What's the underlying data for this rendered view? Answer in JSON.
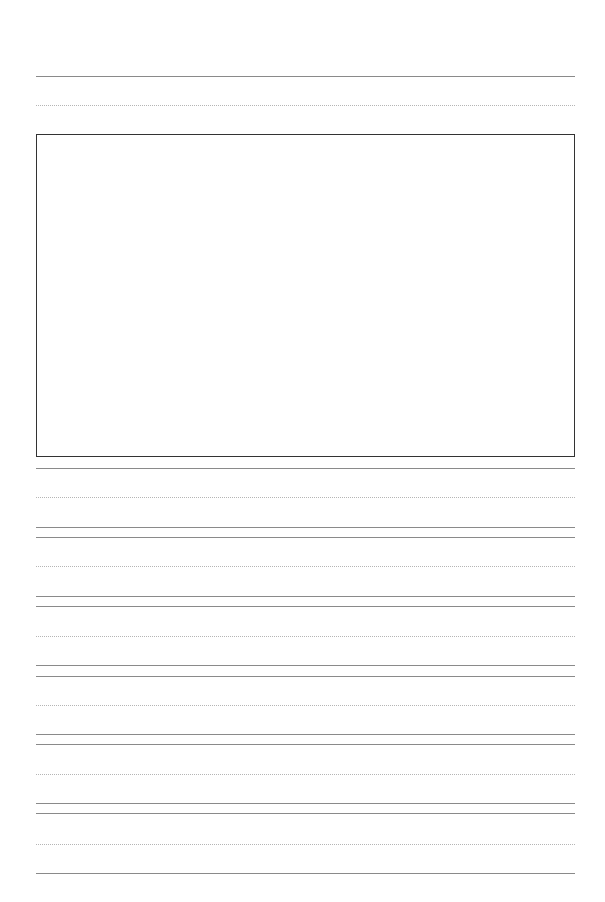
{
  "page": {
    "type": "primary writing paper with drawing box",
    "background": "#ffffff",
    "line_color": "#8a8a8a",
    "dotted_color": "#b5b5b5",
    "box_border_color": "#333333"
  },
  "header_lines": {
    "solid_y": 76,
    "dotted_y": 105
  },
  "drawing_box": {
    "top": 134,
    "left": 36,
    "right": 575,
    "bottom": 456
  },
  "writing_rows": [
    {
      "top_y": 468,
      "dotted_y": 497,
      "base_y": 527
    },
    {
      "top_y": 537,
      "dotted_y": 566,
      "base_y": 596
    },
    {
      "top_y": 606,
      "dotted_y": 636,
      "base_y": 665
    },
    {
      "top_y": 676,
      "dotted_y": 705,
      "base_y": 734
    },
    {
      "top_y": 744,
      "dotted_y": 774,
      "base_y": 803
    },
    {
      "top_y": 813,
      "dotted_y": 844,
      "base_y": 873
    }
  ]
}
